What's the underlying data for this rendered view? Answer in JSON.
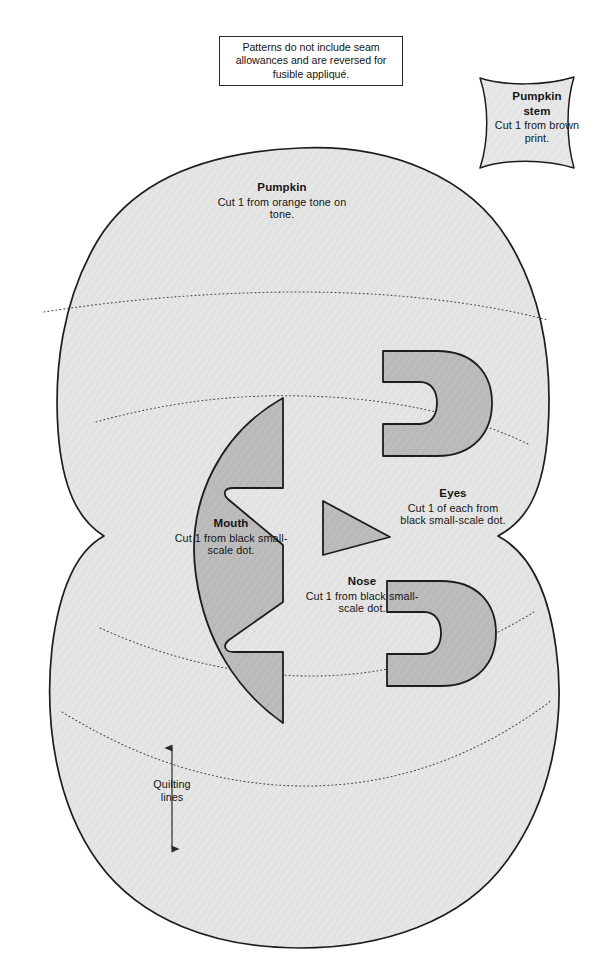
{
  "document": {
    "type": "appliqué pattern sheet",
    "title": "Pumpkin appliqué pattern"
  },
  "note": {
    "text": "Patterns do not include seam allowances and are reversed for fusible appliqué."
  },
  "pieces": {
    "stem": {
      "title": "Pumpkin stem",
      "title_line1": "Pumpkin",
      "title_line2": "stem",
      "instruction": "Cut 1 from brown print."
    },
    "pumpkin": {
      "title": "Pumpkin",
      "instruction": "Cut 1 from orange tone on tone."
    },
    "mouth": {
      "title": "Mouth",
      "instruction": "Cut 1 from black small-scale dot."
    },
    "eyes": {
      "title": "Eyes",
      "instruction": "Cut 1 of each from black small-scale dot."
    },
    "nose": {
      "title": "Nose",
      "instruction": "Cut 1 from black small-scale dot."
    }
  },
  "annotations": {
    "quilting": {
      "label_line1": "Quilting",
      "label_line2": "lines",
      "label": "Quilting lines"
    }
  },
  "colors": {
    "page_background": "#ffffff",
    "body_fill": "#e4e4e4",
    "feature_fill": "#b9b9b9",
    "outline": "#1d1d1d",
    "quilting_line": "#4a4a4a",
    "text": "#151515"
  }
}
